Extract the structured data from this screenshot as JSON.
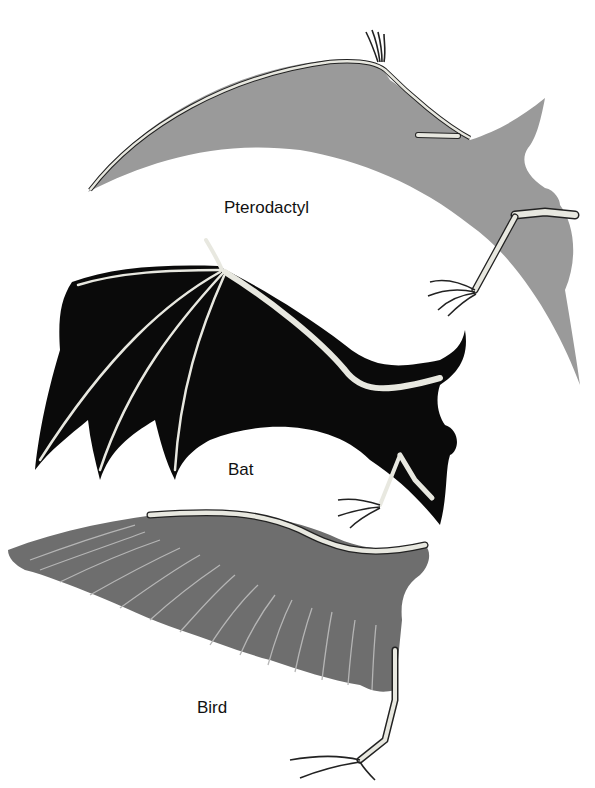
{
  "figure": {
    "labels": [
      {
        "id": "pterodactyl",
        "text": "Pterodactyl"
      },
      {
        "id": "bat",
        "text": "Bat"
      },
      {
        "id": "bird",
        "text": "Bird"
      }
    ],
    "colors": {
      "pterodactyl_membrane": "#9a9a9a",
      "bat_membrane": "#0a0a0a",
      "bird_feathers": "#6e6e6e",
      "bone": "#e8e8e0",
      "bone_outline": "#222222",
      "background": "#ffffff"
    }
  }
}
